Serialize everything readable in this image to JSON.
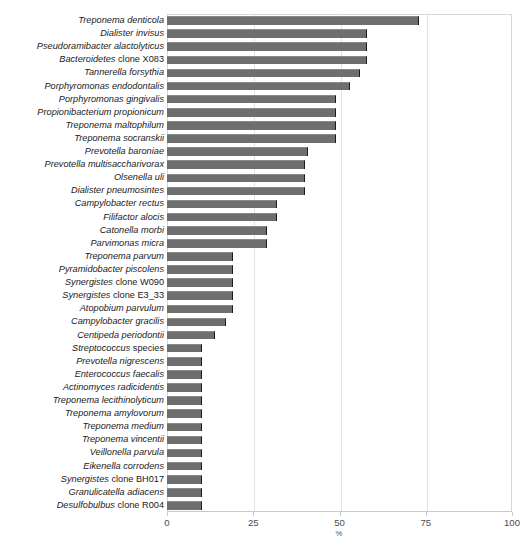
{
  "chart_data": {
    "type": "bar",
    "orientation": "horizontal",
    "title": "",
    "subtitle": "",
    "xlabel": "%",
    "ylabel": "",
    "xlim": [
      0,
      100
    ],
    "xticks": [
      0,
      25,
      50,
      75,
      100
    ],
    "xtick_labels": [
      "0",
      "25",
      "50",
      "75",
      "100"
    ],
    "grid": true,
    "grid_axis": "x",
    "legend": null,
    "bar_color": "#6e6e6e",
    "bar_edge_color": "#1c1c1c",
    "categories": [
      "Treponema denticola",
      "Dialister invisus",
      "Pseudoramibacter alactolyticus",
      "Bacteroidetes clone X083",
      "Tannerella forsythia",
      "Porphyromonas endodontalis",
      "Porphyromonas gingivalis",
      "Propionibacterium propionicum",
      "Treponema maltophilum",
      "Treponema socranskii",
      "Prevotella baroniae",
      "Prevotella multisaccharivorax",
      "Olsenella uli",
      "Dialister pneumosintes",
      "Campylobacter rectus",
      "Filifactor alocis",
      "Catonella morbi",
      "Parvimonas micra",
      "Treponema parvum",
      "Pyramidobacter piscolens",
      "Synergistes clone W090",
      "Synergistes clone E3_33",
      "Atopobium parvulum",
      "Campylobacter gracilis",
      "Centipeda periodontii",
      "Streptococcus species",
      "Prevotella nigrescens",
      "Enterococcus faecalis",
      "Actinomyces radicidentis",
      "Treponema lecithinolyticum",
      "Treponema amylovorum",
      "Treponema medium",
      "Treponema vincentii",
      "Veillonella parvula",
      "Eikenella corrodens",
      "Synergistes clone BH017",
      "Granulicatella adiacens",
      "Desulfobulbus clone R004"
    ],
    "category_nonitalic_suffix": {
      "Bacteroidetes clone X083": "clone X083",
      "Synergistes clone W090": "clone W090",
      "Synergistes clone E3_33": "clone E3_33",
      "Streptococcus species": "species",
      "Synergistes clone BH017": "clone BH017",
      "Desulfobulbus clone R004": "clone R004"
    },
    "values": [
      73,
      58,
      58,
      58,
      56,
      53,
      49,
      49,
      49,
      49,
      41,
      40,
      40,
      40,
      32,
      32,
      29,
      29,
      19,
      19,
      19,
      19,
      19,
      17,
      14,
      10,
      10,
      10,
      10,
      10,
      10,
      10,
      10,
      10,
      10,
      10,
      10,
      10
    ]
  }
}
